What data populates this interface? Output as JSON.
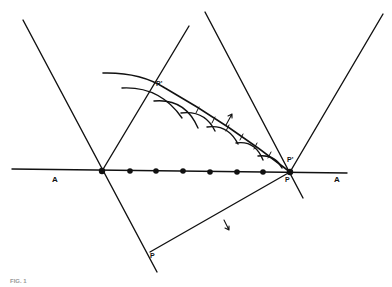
{
  "figure": {
    "caption_fragment": "FIG. 1",
    "labels": {
      "axis_left": "A",
      "axis_right": "A",
      "p_prime_left": "P'",
      "p_prime_right": "P'",
      "p_right": "P",
      "p_bottom": "P"
    }
  },
  "geometry": {
    "axis_line": {
      "x1": 12,
      "y1": 169,
      "x2": 347,
      "y2": 173
    },
    "left_node": {
      "x": 102,
      "y": 171
    },
    "right_node": {
      "x": 290,
      "y": 172
    },
    "dots_x": [
      130,
      156,
      183,
      210,
      237,
      263
    ],
    "colors": {
      "ink": "#111111",
      "paper": "#ffffff"
    }
  }
}
